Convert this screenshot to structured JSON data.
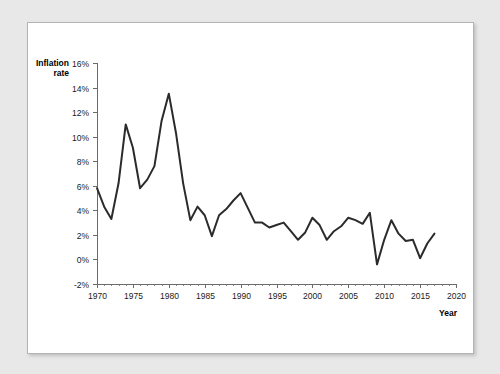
{
  "chart_data": {
    "type": "line",
    "title": "",
    "xlabel": "Year",
    "ylabel": "Inflation rate",
    "xlim": [
      1970,
      2020
    ],
    "ylim": [
      -2,
      16
    ],
    "grid": false,
    "legend": "none",
    "x_tick_labels": [
      "1970",
      "1975",
      "1980",
      "1985",
      "1990",
      "1995",
      "2000",
      "2005",
      "2010",
      "2015",
      "2020"
    ],
    "x_tick_values": [
      1970,
      1975,
      1980,
      1985,
      1990,
      1995,
      2000,
      2005,
      2010,
      2015,
      2020
    ],
    "x_minor_step": 1,
    "y_tick_labels": [
      "-2%",
      "0%",
      "2%",
      "4%",
      "6%",
      "8%",
      "10%",
      "12%",
      "14%",
      "16%"
    ],
    "y_tick_values": [
      -2,
      0,
      2,
      4,
      6,
      8,
      10,
      12,
      14,
      16
    ],
    "series": [
      {
        "name": "Inflation rate",
        "color": "#2b2b2b",
        "x": [
          1970,
          1971,
          1972,
          1973,
          1974,
          1975,
          1976,
          1977,
          1978,
          1979,
          1980,
          1981,
          1982,
          1983,
          1984,
          1985,
          1986,
          1987,
          1988,
          1989,
          1990,
          1991,
          1992,
          1993,
          1994,
          1995,
          1996,
          1997,
          1998,
          1999,
          2000,
          2001,
          2002,
          2003,
          2004,
          2005,
          2006,
          2007,
          2008,
          2009,
          2010,
          2011,
          2012,
          2013,
          2014,
          2015,
          2016,
          2017
        ],
        "values": [
          5.8,
          4.3,
          3.3,
          6.2,
          11.0,
          9.1,
          5.8,
          6.5,
          7.6,
          11.3,
          13.5,
          10.3,
          6.2,
          3.2,
          4.3,
          3.6,
          1.9,
          3.6,
          4.1,
          4.8,
          5.4,
          4.2,
          3.0,
          3.0,
          2.6,
          2.8,
          3.0,
          2.3,
          1.6,
          2.2,
          3.4,
          2.8,
          1.6,
          2.3,
          2.7,
          3.4,
          3.2,
          2.9,
          3.8,
          -0.4,
          1.6,
          3.2,
          2.1,
          1.5,
          1.6,
          0.1,
          1.3,
          2.1
        ]
      }
    ]
  },
  "axis_titles": {
    "y_line1": "Inflation",
    "y_line2": "rate",
    "x": "Year"
  }
}
